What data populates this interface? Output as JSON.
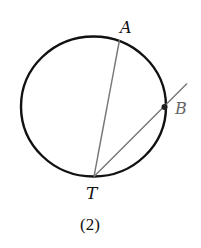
{
  "diagram": {
    "caption": "(2)",
    "circle": {
      "cx": 93.5,
      "cy": 106.5,
      "rx": 72.5,
      "ry": 70,
      "stroke": "#111111"
    },
    "points": {
      "A": {
        "label": "A",
        "x": 119.5,
        "y": 40
      },
      "B": {
        "label": "B",
        "x": 164.5,
        "y": 107
      },
      "T": {
        "label": "T",
        "x": 94,
        "y": 176.5
      }
    },
    "segments": [
      {
        "name": "chord-TA",
        "from": "T",
        "to": "A"
      },
      {
        "name": "secant-TB",
        "from": "T",
        "to": "B",
        "extends_to": [
          187,
          83.5
        ]
      }
    ],
    "line_color": "#777777",
    "label_color_B": "#666666"
  }
}
